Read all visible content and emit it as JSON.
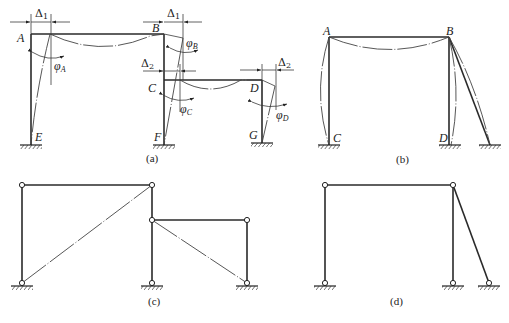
{
  "figure": {
    "panels": [
      {
        "id": "a",
        "caption": "(a)",
        "nodes": {
          "A": "A",
          "B": "B",
          "C": "C",
          "D": "D",
          "E": "E",
          "F": "F",
          "G": "G"
        },
        "displacements": {
          "delta1": "Δ",
          "delta1_sub": "1",
          "delta2": "Δ",
          "delta2_sub": "2"
        },
        "rotations": {
          "phiA": "φ",
          "phiA_sub": "A",
          "phiB": "φ",
          "phiB_sub": "B",
          "phiC": "φ",
          "phiC_sub": "C",
          "phiD": "φ",
          "phiD_sub": "D"
        }
      },
      {
        "id": "b",
        "caption": "(b)",
        "nodes": {
          "A": "A",
          "B": "B",
          "C": "C",
          "D": "D"
        }
      },
      {
        "id": "c",
        "caption": "(c)"
      },
      {
        "id": "d",
        "caption": "(d)"
      }
    ]
  }
}
